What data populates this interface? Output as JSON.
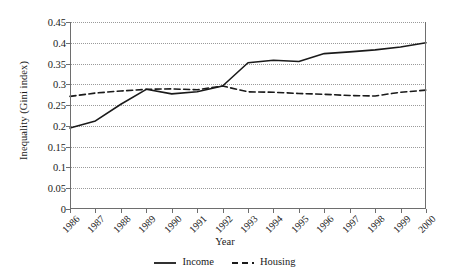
{
  "chart_data": {
    "type": "line",
    "title": "",
    "xlabel": "Year",
    "ylabel": "Inequality (Gini index)",
    "categories": [
      "1986",
      "1987",
      "1988",
      "1989",
      "1990",
      "1991",
      "1992",
      "1993",
      "1994",
      "1995",
      "1996",
      "1997",
      "1998",
      "1999",
      "2000"
    ],
    "x": [
      1986,
      1987,
      1988,
      1989,
      1990,
      1991,
      1992,
      1993,
      1994,
      1995,
      1996,
      1997,
      1998,
      1999,
      2000
    ],
    "xlim": [
      1986,
      2000
    ],
    "ylim": [
      0,
      0.45
    ],
    "yticks": [
      0,
      0.05,
      0.1,
      0.15,
      0.2,
      0.25,
      0.3,
      0.35,
      0.4,
      0.45
    ],
    "ytick_labels": [
      "0",
      "0.05",
      "0.1",
      "0.15",
      "0.2",
      "0.25",
      "0.3",
      "0.35",
      "0.4",
      "0.45"
    ],
    "grid": true,
    "grid_axis": "y",
    "grid_style": "dotted",
    "legend_position": "bottom",
    "series": [
      {
        "name": "Income",
        "style": "solid",
        "color": "#1a1a1a",
        "values": [
          0.195,
          0.212,
          0.252,
          0.288,
          0.277,
          0.282,
          0.296,
          0.352,
          0.358,
          0.355,
          0.374,
          0.378,
          0.383,
          0.39,
          0.4
        ]
      },
      {
        "name": "Housing",
        "style": "dashed",
        "color": "#1a1a1a",
        "values": [
          0.271,
          0.279,
          0.284,
          0.288,
          0.289,
          0.287,
          0.296,
          0.282,
          0.281,
          0.278,
          0.276,
          0.273,
          0.272,
          0.281,
          0.286
        ]
      }
    ]
  },
  "legend": {
    "items": [
      {
        "label": "Income",
        "icon": "solid-line-swatch"
      },
      {
        "label": "Housing",
        "icon": "dashed-line-swatch"
      }
    ]
  },
  "axes": {
    "x_title": "Year",
    "y_title": "Inequality (Gini index)"
  },
  "colors": {
    "series": "#1a1a1a",
    "grid": "#9a9a9a",
    "axis": "#6e6e6e",
    "background": "#ffffff"
  }
}
